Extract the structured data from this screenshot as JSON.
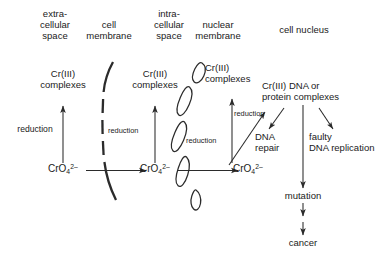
{
  "figure": {
    "background_color": "#ffffff",
    "stroke_color": "#2b2b2b"
  },
  "zones": [
    {
      "id": "extracellular-space",
      "label": "extra-\ncellular\nspace"
    },
    {
      "id": "cell-membrane",
      "label": "cell\nmembrane"
    },
    {
      "id": "intracellular-space",
      "label": "intra-\ncellular\nspace"
    },
    {
      "id": "nuclear-membrane",
      "label": "nuclear\nmembrane"
    },
    {
      "id": "cell-nucleus",
      "label": "cell nucleus"
    }
  ],
  "species": {
    "chromate_1": {
      "formula": "CrO",
      "sub": "4",
      "sup": "2–"
    },
    "chromate_2": {
      "formula": "CrO",
      "sub": "4",
      "sup": "2–"
    },
    "chromate_3": {
      "formula": "CrO",
      "sub": "4",
      "sup": "2–"
    },
    "cr3_complexes_extracellular": "Cr(III)\ncomplexes",
    "cr3_complexes_intracellular": "Cr(III)\ncomplexes",
    "cr3_complexes_nuclear": "Cr(III)\ncomplexes",
    "cr3_dna_protein_complexes": "Cr(III) DNA or\nprotein complexes"
  },
  "processes": {
    "reduction_extracellular": "reduction",
    "reduction_membrane": "reduction",
    "reduction_intracellular": "reduction",
    "reduction_nuclear": "reduction",
    "reduction_nucleus": "reduction"
  },
  "outcomes": {
    "dna_repair": "DNA\nrepair",
    "faulty_dna_replication": "faulty\nDNA replication",
    "mutation": "mutation",
    "cancer": "cancer"
  }
}
